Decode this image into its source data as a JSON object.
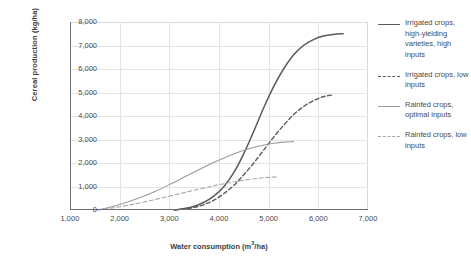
{
  "chart_data": {
    "type": "line",
    "title": "",
    "xlabel": "Water consumption (m³/ha)",
    "ylabel": "Cereal production (kg/ha)",
    "xlim": [
      1000,
      7000
    ],
    "ylim": [
      0,
      8000
    ],
    "grid": true,
    "legend_position": "right",
    "xticks": [
      "1,000",
      "2,000",
      "3,000",
      "4,000",
      "5,000",
      "6,000",
      "7,000"
    ],
    "yticks": [
      "0",
      "1,000",
      "2,000",
      "3,000",
      "4,000",
      "5,000",
      "6,000",
      "7,000",
      "8,000"
    ],
    "series": [
      {
        "name": "Irrigated crops, high-yielding varieties, high inputs",
        "style": "solid",
        "color": "#5a5a5a",
        "width": 1.5,
        "x": [
          3100,
          3300,
          3500,
          3700,
          3900,
          4100,
          4300,
          4500,
          4700,
          4900,
          5100,
          5300,
          5500,
          5700,
          5900,
          6100,
          6300,
          6500
        ],
        "y": [
          0,
          60,
          160,
          330,
          600,
          1000,
          1600,
          2400,
          3350,
          4350,
          5250,
          6000,
          6600,
          7000,
          7250,
          7400,
          7470,
          7500
        ]
      },
      {
        "name": "Irrigated crops, low inputs",
        "style": "dashed",
        "color": "#5a5a5a",
        "width": 1.4,
        "x": [
          3100,
          3300,
          3500,
          3700,
          3900,
          4100,
          4300,
          4500,
          4700,
          4900,
          5100,
          5300,
          5500,
          5700,
          5900,
          6100,
          6300
        ],
        "y": [
          0,
          40,
          110,
          230,
          420,
          700,
          1050,
          1500,
          2000,
          2550,
          3100,
          3600,
          4050,
          4400,
          4650,
          4820,
          4900
        ]
      },
      {
        "name": "Rainfed crops, optimal inputs",
        "style": "solid",
        "color": "#9a9a9a",
        "width": 1.1,
        "x": [
          1550,
          1800,
          2100,
          2400,
          2700,
          3000,
          3300,
          3600,
          3900,
          4200,
          4500,
          4800,
          5100,
          5300,
          5500
        ],
        "y": [
          0,
          120,
          300,
          520,
          780,
          1080,
          1400,
          1720,
          2030,
          2300,
          2540,
          2720,
          2840,
          2890,
          2910
        ]
      },
      {
        "name": "Rainfed crops, low inputs",
        "style": "dashed",
        "color": "#a8a8a8",
        "width": 1.1,
        "x": [
          1550,
          1800,
          2100,
          2400,
          2700,
          3000,
          3300,
          3600,
          3900,
          4200,
          4500,
          4800,
          5000,
          5200
        ],
        "y": [
          0,
          70,
          175,
          300,
          440,
          590,
          740,
          890,
          1030,
          1160,
          1270,
          1350,
          1390,
          1410
        ]
      }
    ],
    "legend": [
      {
        "label": "Irrigated crops, high-yielding varieties, high inputs",
        "style": "solid-dark"
      },
      {
        "label": "Irrigated crops, low inputs",
        "style": "dash-dark"
      },
      {
        "label": "Rainfed crops, optimal inputs",
        "style": "solid-light"
      },
      {
        "label": "Rainfed crops, low inputs",
        "style": "dash-light"
      }
    ]
  }
}
